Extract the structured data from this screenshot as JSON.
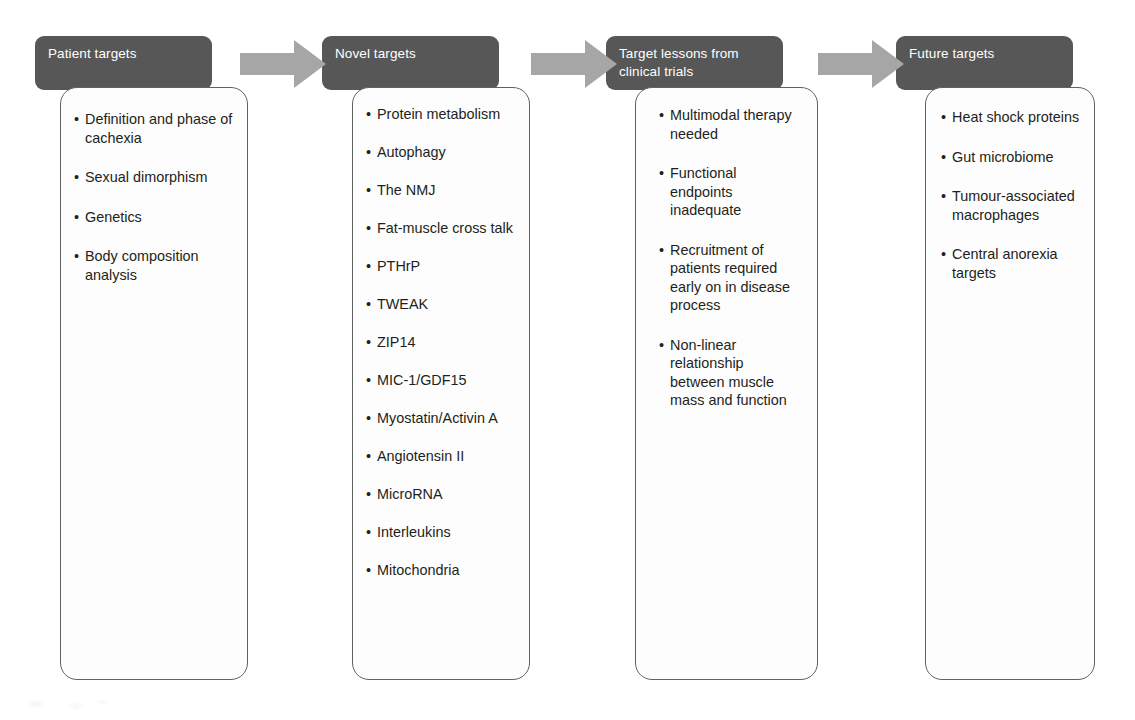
{
  "diagram": {
    "type": "process-flow",
    "direction": "left-to-right",
    "arrow_count": 3,
    "colors": {
      "header_fill": "#575757",
      "header_text": "#ffffff",
      "body_fill": "#fdfdfd",
      "body_border": "#616161",
      "body_text": "#231f20",
      "arrow_fill": "#a6a6a6",
      "page_background": "#ffffff"
    },
    "bullet_glyph": "•",
    "columns": [
      {
        "id": "patient-targets",
        "header": "Patient targets",
        "items": [
          "Definition and phase of cachexia",
          "Sexual dimorphism",
          "Genetics",
          "Body composition analysis"
        ]
      },
      {
        "id": "novel-targets",
        "header": "Novel targets",
        "items": [
          "Protein metabolism",
          "Autophagy",
          "The NMJ",
          "Fat-muscle cross talk",
          "PTHrP",
          "TWEAK",
          "ZIP14",
          "MIC-1/GDF15",
          "Myostatin/Activin A",
          "Angiotensin II",
          "MicroRNA",
          "Interleukins",
          "Mitochondria"
        ]
      },
      {
        "id": "target-lessons-from-clinical-trials",
        "header": "Target lessons from clinical trials",
        "items": [
          "Multimodal therapy needed",
          "Functional endpoints inadequate",
          "Recruitment of patients required early on in disease process",
          "Non-linear relationship between muscle mass and function"
        ]
      },
      {
        "id": "future-targets",
        "header": "Future targets",
        "items": [
          "Heat shock proteins",
          "Gut microbiome",
          "Tumour-associated macrophages",
          "Central anorexia targets"
        ]
      }
    ]
  }
}
